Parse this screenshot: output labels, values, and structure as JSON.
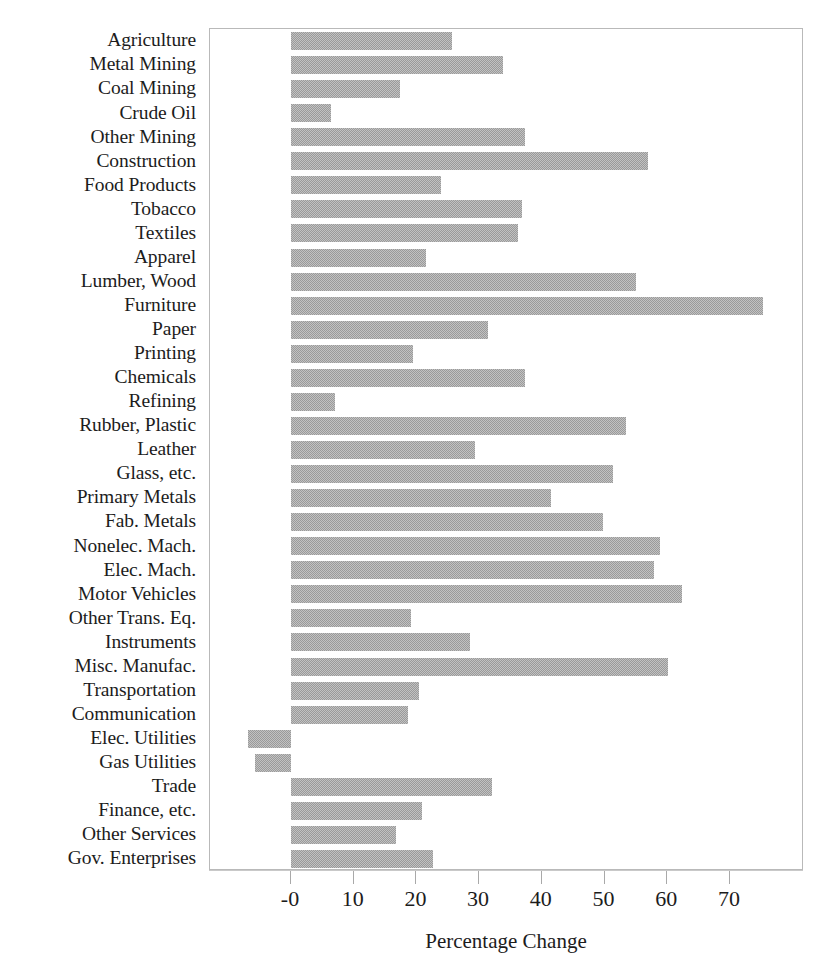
{
  "chart_data": {
    "type": "bar",
    "orientation": "horizontal",
    "title": "",
    "xlabel": "Percentage Change",
    "ylabel": "",
    "xlim": [
      -10.4,
      84.3
    ],
    "grid": false,
    "legend": null,
    "bar_color": "#9a9a9a",
    "xticks": [
      {
        "label": "-0",
        "value": 0
      },
      {
        "label": "10",
        "value": 10
      },
      {
        "label": "20",
        "value": 20
      },
      {
        "label": "30",
        "value": 30
      },
      {
        "label": "40",
        "value": 40
      },
      {
        "label": "50",
        "value": 50
      },
      {
        "label": "60",
        "value": 60
      },
      {
        "label": "70",
        "value": 70
      }
    ],
    "categories": [
      "Agriculture",
      "Metal Mining",
      "Coal Mining",
      "Crude Oil",
      "Other Mining",
      "Construction",
      "Food Products",
      "Tobacco",
      "Textiles",
      "Apparel",
      "Lumber, Wood",
      "Furniture",
      "Paper",
      "Printing",
      "Chemicals",
      "Refining",
      "Rubber, Plastic",
      "Leather",
      "Glass, etc.",
      "Primary Metals",
      "Fab. Metals",
      "Nonelec. Mach.",
      "Elec. Mach.",
      "Motor Vehicles",
      "Other Trans. Eq.",
      "Instruments",
      "Misc. Manufac.",
      "Transportation",
      "Communication",
      "Elec. Utilities",
      "Gas Utilities",
      "Trade",
      "Finance, etc.",
      "Other Services",
      "Gov. Enterprises"
    ],
    "values": [
      25.6,
      33.8,
      17.4,
      6.3,
      37.3,
      57.0,
      23.9,
      36.8,
      36.2,
      21.5,
      55.0,
      75.2,
      31.4,
      19.5,
      37.3,
      7.0,
      53.4,
      29.3,
      51.3,
      41.4,
      49.7,
      58.8,
      57.9,
      62.3,
      19.1,
      28.6,
      60.2,
      20.4,
      18.6,
      -6.9,
      -5.8,
      32.0,
      20.9,
      16.8,
      22.6
    ]
  }
}
